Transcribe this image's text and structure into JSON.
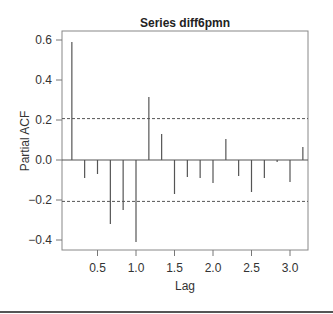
{
  "chart_data": {
    "type": "bar",
    "subtype": "pacf-stem",
    "title": "Series diff6pmn",
    "xlabel": "Lag",
    "ylabel": "Partial ACF",
    "xlim": [
      0,
      3.25
    ],
    "ylim": [
      -0.45,
      0.65
    ],
    "xticks": [
      0.5,
      1.0,
      1.5,
      2.0,
      2.5,
      3.0
    ],
    "xtick_labels": [
      "0.5",
      "1.0",
      "1.5",
      "2.0",
      "2.5",
      "3.0"
    ],
    "yticks": [
      -0.4,
      -0.2,
      0.0,
      0.2,
      0.4,
      0.6
    ],
    "ytick_labels": [
      "−0.4",
      "−0.2",
      "0.0",
      "0.2",
      "0.4",
      "0.6"
    ],
    "grid": false,
    "confidence_bounds": [
      0.207,
      -0.207
    ],
    "x": [
      0.167,
      0.333,
      0.5,
      0.667,
      0.833,
      1.0,
      1.167,
      1.333,
      1.5,
      1.667,
      1.833,
      2.0,
      2.167,
      2.333,
      2.5,
      2.667,
      2.833,
      3.0,
      3.167
    ],
    "values": [
      0.59,
      -0.09,
      -0.07,
      -0.32,
      -0.25,
      -0.41,
      0.315,
      0.13,
      -0.17,
      -0.085,
      -0.09,
      -0.115,
      0.105,
      -0.08,
      -0.16,
      -0.09,
      -0.01,
      -0.11,
      0.065
    ],
    "colors": {
      "stem": "#555555",
      "axis": "#777777",
      "bound": "#555555",
      "text": "#333333"
    }
  }
}
